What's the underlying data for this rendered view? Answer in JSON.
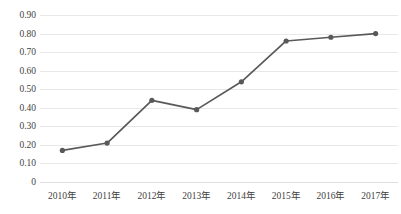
{
  "chart_data": {
    "type": "line",
    "title": "",
    "subtitle": "",
    "xlabel": "",
    "ylabel": "",
    "categories": [
      "2010年",
      "2011年",
      "2012年",
      "2013年",
      "2014年",
      "2015年",
      "2016年",
      "2017年"
    ],
    "values": [
      0.17,
      0.21,
      0.44,
      0.39,
      0.54,
      0.76,
      0.78,
      0.8
    ],
    "series": [
      {
        "name": "",
        "values": [
          0.17,
          0.21,
          0.44,
          0.39,
          0.54,
          0.76,
          0.78,
          0.8
        ]
      }
    ],
    "ylim": [
      0,
      0.9
    ],
    "ytick_labels": [
      "0.90",
      "0.80",
      "0.70",
      "0.60",
      "0.50",
      "0.40",
      "0.30",
      "0.20",
      "0.10",
      "0"
    ],
    "ytick_values": [
      0.9,
      0.8,
      0.7,
      0.6,
      0.5,
      0.4,
      0.3,
      0.2,
      0.1,
      0
    ],
    "grid": true,
    "legend": false,
    "legend_position": "none",
    "markers": true,
    "annotations": []
  },
  "style": {
    "line_color": "#595959",
    "marker_color": "#595959",
    "grid_color": "#e8e8e8",
    "text_color": "#3f3f3f",
    "background": "#ffffff"
  }
}
